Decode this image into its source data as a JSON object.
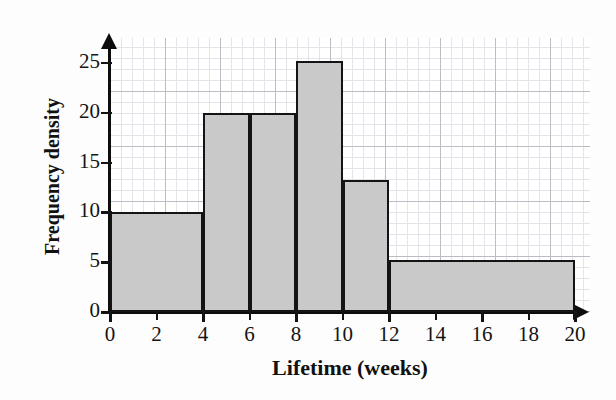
{
  "chart_data": {
    "type": "bar",
    "title": "",
    "xlabel": "Lifetime (weeks)",
    "ylabel": "Frequency density",
    "xlim": [
      0,
      20
    ],
    "ylim": [
      0,
      27.5
    ],
    "grid": true,
    "legend": "none",
    "x_ticks": [
      "0",
      "2",
      "4",
      "6",
      "8",
      "10",
      "12",
      "14",
      "16",
      "18",
      "20"
    ],
    "x_tick_values": [
      0,
      2,
      4,
      6,
      8,
      10,
      12,
      14,
      16,
      18,
      20
    ],
    "y_ticks": [
      "0",
      "5",
      "10",
      "15",
      "20",
      "25"
    ],
    "y_tick_values": [
      0,
      5,
      10,
      15,
      20,
      25
    ],
    "bins": [
      {
        "label": "0-4",
        "start": 0,
        "end": 4,
        "value": 10
      },
      {
        "label": "4-6",
        "start": 4,
        "end": 6,
        "value": 20
      },
      {
        "label": "6-8",
        "start": 6,
        "end": 8,
        "value": 20
      },
      {
        "label": "8-10",
        "start": 8,
        "end": 10,
        "value": 25.2
      },
      {
        "label": "10-12",
        "start": 10,
        "end": 12,
        "value": 13.2
      },
      {
        "label": "12-20",
        "start": 12,
        "end": 20,
        "value": 5.2
      }
    ],
    "colors": {
      "bar_fill": "#c9c9c9",
      "bar_edge": "#141414",
      "axis": "#0d0d0d",
      "grid_major": "#bcbcc4",
      "grid_minor": "#e3e3ea",
      "background": "#fdfdfd"
    }
  }
}
